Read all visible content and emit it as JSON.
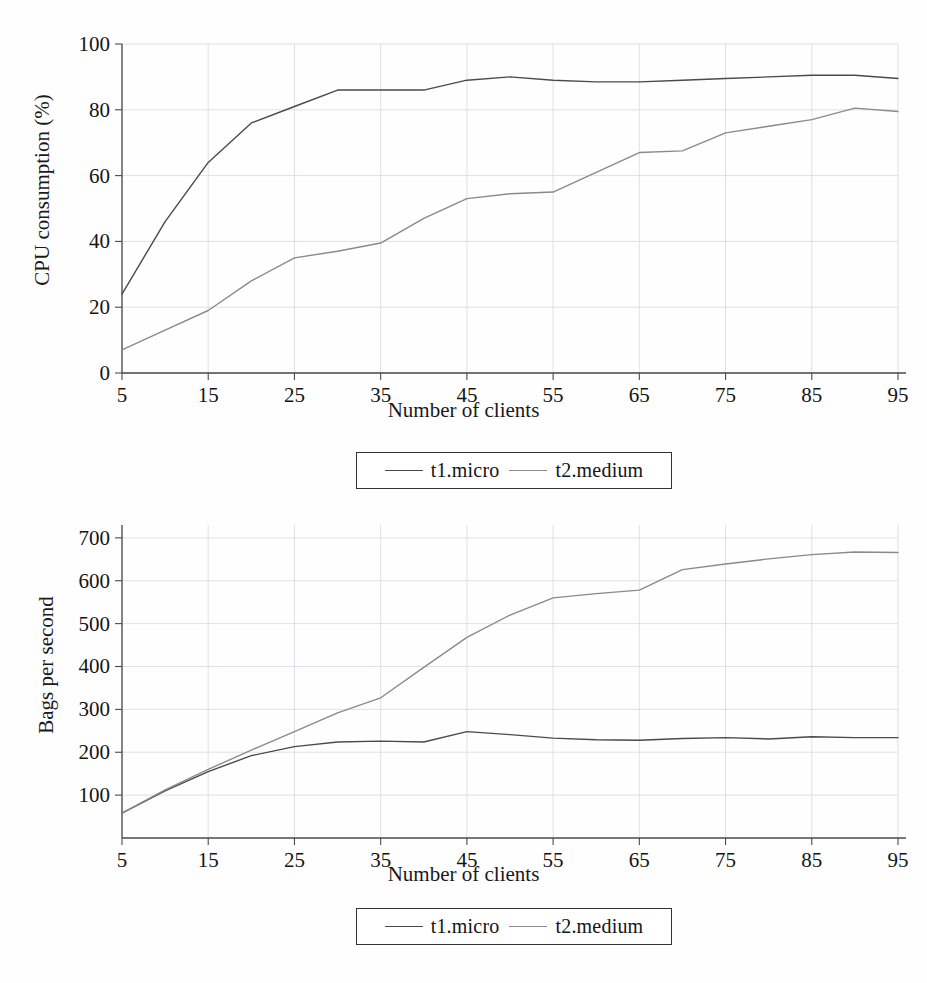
{
  "document": {
    "kind": "scanned-figure-page",
    "background_color": "#fefefe"
  },
  "figures": [
    {
      "id": "cpu-consumption-figure",
      "xlabel": "Number of clients",
      "ylabel": "CPU consumption (%)",
      "legend": [
        {
          "label": "t1.micro",
          "color": "#4a4a4a"
        },
        {
          "label": "t2.medium",
          "color": "#8a8a8a"
        }
      ]
    },
    {
      "id": "throughput-figure",
      "xlabel": "Number of clients",
      "ylabel": "Bags per second",
      "legend": [
        {
          "label": "t1.micro",
          "color": "#4a4a4a"
        },
        {
          "label": "t2.medium",
          "color": "#8a8a8a"
        }
      ]
    }
  ],
  "chart_data": [
    {
      "type": "line",
      "id": "cpu-consumption",
      "title": "",
      "xlabel": "Number of clients",
      "ylabel": "CPU consumption (%)",
      "xlim": [
        5,
        95
      ],
      "ylim": [
        0,
        100
      ],
      "grid": true,
      "legend_position": "below-plot",
      "xticks": [
        5,
        15,
        25,
        35,
        45,
        55,
        65,
        75,
        85,
        95
      ],
      "xtick_labels": [
        "5",
        "15",
        "25",
        "35",
        "45",
        "55",
        "65",
        "75",
        "85",
        "95"
      ],
      "yticks": [
        0,
        20,
        40,
        60,
        80,
        100
      ],
      "ytick_labels": [
        "0",
        "20",
        "40",
        "60",
        "80",
        "100"
      ],
      "x": [
        5,
        10,
        15,
        20,
        25,
        30,
        35,
        40,
        45,
        50,
        55,
        60,
        65,
        70,
        75,
        80,
        85,
        90,
        95
      ],
      "series": [
        {
          "name": "t1.micro",
          "color": "#4a4a4a",
          "values": [
            24,
            46,
            64,
            76,
            81,
            86,
            86,
            86,
            89,
            90,
            89,
            88.5,
            88.5,
            89,
            89.5,
            90,
            90.5,
            90.5,
            89.5
          ]
        },
        {
          "name": "t2.medium",
          "color": "#8a8a8a",
          "values": [
            7,
            13,
            19,
            28,
            35,
            37,
            39.5,
            47,
            53,
            54.5,
            55,
            61,
            67,
            67.5,
            73,
            75,
            77,
            80.5,
            79.5
          ]
        }
      ]
    },
    {
      "type": "line",
      "id": "bags-per-second",
      "title": "",
      "xlabel": "Number of clients",
      "ylabel": "Bags per second",
      "xlim": [
        5,
        95
      ],
      "ylim": [
        0,
        730
      ],
      "grid": true,
      "legend_position": "below-plot",
      "xticks": [
        5,
        15,
        25,
        35,
        45,
        55,
        65,
        75,
        85,
        95
      ],
      "xtick_labels": [
        "5",
        "15",
        "25",
        "35",
        "45",
        "55",
        "65",
        "75",
        "85",
        "95"
      ],
      "yticks": [
        100,
        200,
        300,
        400,
        500,
        600,
        700
      ],
      "ytick_labels": [
        "100",
        "200",
        "300",
        "400",
        "500",
        "600",
        "700"
      ],
      "x": [
        5,
        10,
        15,
        20,
        25,
        30,
        35,
        40,
        45,
        50,
        55,
        60,
        65,
        70,
        75,
        80,
        85,
        90,
        95
      ],
      "series": [
        {
          "name": "t1.micro",
          "color": "#4a4a4a",
          "values": [
            58,
            110,
            155,
            192,
            213,
            224,
            226,
            224,
            248,
            241,
            233,
            229,
            228,
            232,
            234,
            231,
            236,
            234,
            234
          ]
        },
        {
          "name": "t2.medium",
          "color": "#8a8a8a",
          "values": [
            58,
            112,
            160,
            205,
            248,
            292,
            327,
            398,
            468,
            520,
            560,
            570,
            578,
            626,
            639,
            651,
            661,
            667,
            666
          ]
        }
      ]
    }
  ]
}
